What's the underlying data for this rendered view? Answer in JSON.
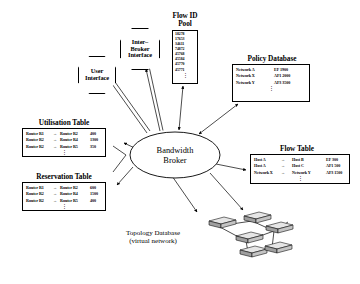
{
  "diagram": {
    "center": {
      "name": "Bandwidth Broker",
      "line1": "Bandwidth",
      "line2": "Broker"
    },
    "octagons": [
      {
        "id": "user-interface",
        "line1": "User",
        "line2": "Interface"
      },
      {
        "id": "inter-broker-interface",
        "line1": "Inter–",
        "line2": "Broker",
        "line3": "Interface"
      }
    ],
    "flow_id_pool": {
      "title_line1": "Flow ID",
      "title_line2": "Pool",
      "ids": [
        "18278",
        "17653",
        "34611",
        "74872",
        "45768",
        "45584",
        "45770",
        "45771"
      ],
      "continuation": "⋮"
    },
    "policy_database": {
      "title": "Policy Database",
      "rows": [
        {
          "network": "Network A",
          "service": "EF 1900"
        },
        {
          "network": "Network X",
          "service": "AF1 2000"
        },
        {
          "network": "Network Y",
          "service": "AF3 3500"
        }
      ],
      "continuation": "⋮"
    },
    "utilisation_table": {
      "title": "Utilisation Table",
      "rows": [
        {
          "src": "Router R1",
          "arrow": "→",
          "dst": "Router R2",
          "value": "400"
        },
        {
          "src": "Router R2",
          "arrow": "→",
          "dst": "Router R4",
          "value": "1300"
        },
        {
          "src": "Router R2",
          "arrow": "→",
          "dst": "Router R5",
          "value": "350"
        }
      ],
      "continuation": "⋮"
    },
    "reservation_table": {
      "title": "Reservation Table",
      "rows": [
        {
          "src": "Router R1",
          "arrow": "→",
          "dst": "Router R2",
          "value": "600"
        },
        {
          "src": "Router R2",
          "arrow": "→",
          "dst": "Router R4",
          "value": "1500"
        },
        {
          "src": "Router R2",
          "arrow": "→",
          "dst": "Router R5",
          "value": "400"
        }
      ],
      "continuation": "⋮"
    },
    "flow_table": {
      "title": "Flow Table",
      "rows": [
        {
          "src": "Host A",
          "arrow": "→",
          "dst": "Host B",
          "value": "EF 300"
        },
        {
          "src": "Host A",
          "arrow": "→",
          "dst": "Host C",
          "value": "AF1 500"
        },
        {
          "src": "Network X",
          "arrow": "→",
          "dst": "Network Y",
          "value": "AF3 1500"
        }
      ],
      "continuation": "⋮"
    },
    "topology_database": {
      "title_line1": "Topology Database",
      "title_line2": "(virtual network)"
    },
    "colors": {
      "stroke": "#000000",
      "background": "#ffffff",
      "router_body": "#d8d8d8"
    }
  }
}
